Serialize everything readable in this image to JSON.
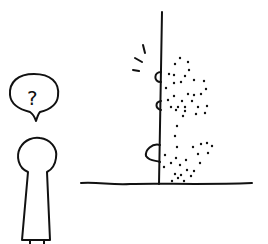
{
  "figure": {
    "type": "hand-drawn illustration",
    "speech_bubble": {
      "text": "?"
    },
    "elements": [
      "figure-person",
      "speech-bubble",
      "vertical-wall",
      "ground-line",
      "dotted-ghost-figure",
      "motion-lines",
      "hands-on-wall"
    ]
  }
}
